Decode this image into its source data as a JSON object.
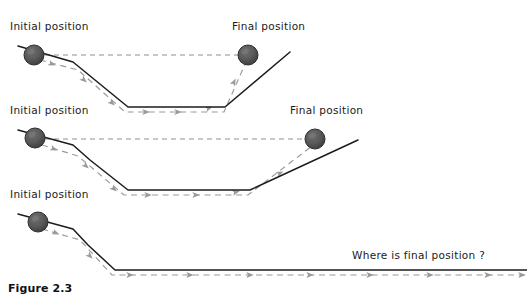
{
  "figure": {
    "caption": "Figure 2.3",
    "background_color": "#ffffff",
    "ink_color": "#1c1c1c",
    "dash_color": "#9a9a9a",
    "ball_color": "#555555"
  },
  "panels": [
    {
      "id": "panel-steep-valley",
      "initial_label": "Initial position",
      "final_label": "Final position",
      "track_points": "18,46 73,62 128,107 195,107 225,107 290,52",
      "level_line": "36,55 248,55",
      "path_points": "40,60 78,70 125,112 190,112 224,112 246,62",
      "balls": [
        {
          "name": "initial-ball",
          "cx": 34,
          "cy": 55,
          "r": 10
        },
        {
          "name": "final-ball",
          "cx": 248,
          "cy": 55,
          "r": 10
        }
      ],
      "initial_label_pos": {
        "x": 10,
        "y": 30
      },
      "final_label_pos": {
        "x": 232,
        "y": 30
      },
      "arrow_positions": [
        {
          "x": 52,
          "y": 64,
          "angle": 22
        },
        {
          "x": 84,
          "y": 80,
          "angle": 42
        },
        {
          "x": 112,
          "y": 103,
          "angle": 42
        },
        {
          "x": 146,
          "y": 112,
          "angle": 0
        },
        {
          "x": 178,
          "y": 112,
          "angle": 0
        },
        {
          "x": 209,
          "y": 108,
          "angle": -20
        },
        {
          "x": 234,
          "y": 82,
          "angle": -63
        }
      ]
    },
    {
      "id": "panel-gentle-valley",
      "initial_label": "Initial position",
      "final_label": "Final position",
      "track_points": "18,130 73,145 90,160 128,190 203,190 250,190 358,140",
      "level_line": "36,139 315,139",
      "path_points": "42,145 78,156 124,195 200,195 248,195 312,146",
      "balls": [
        {
          "name": "initial-ball",
          "cx": 35,
          "cy": 138,
          "r": 10
        },
        {
          "name": "final-ball",
          "cx": 315,
          "cy": 139,
          "r": 10
        }
      ],
      "initial_label_pos": {
        "x": 10,
        "y": 114
      },
      "final_label_pos": {
        "x": 290,
        "y": 114
      },
      "arrow_positions": [
        {
          "x": 54,
          "y": 149,
          "angle": 22
        },
        {
          "x": 86,
          "y": 166,
          "angle": 42
        },
        {
          "x": 114,
          "y": 189,
          "angle": 42
        },
        {
          "x": 148,
          "y": 195,
          "angle": 0
        },
        {
          "x": 196,
          "y": 195,
          "angle": 0
        },
        {
          "x": 236,
          "y": 192,
          "angle": -13
        },
        {
          "x": 280,
          "y": 173,
          "angle": -25
        }
      ]
    },
    {
      "id": "panel-flat-track",
      "initial_label": "Initial position",
      "question_label": "Where is final position ?",
      "track_points": "18,214 73,229 88,245 115,270 527,270",
      "path_points": "42,229 80,240 112,275 527,275",
      "balls": [
        {
          "name": "initial-ball",
          "cx": 38,
          "cy": 222,
          "r": 10
        }
      ],
      "initial_label_pos": {
        "x": 10,
        "y": 198
      },
      "question_label_pos": {
        "x": 352,
        "y": 259
      },
      "arrow_positions": [
        {
          "x": 56,
          "y": 233,
          "angle": 22
        },
        {
          "x": 90,
          "y": 256,
          "angle": 45
        },
        {
          "x": 130,
          "y": 275,
          "angle": 0
        },
        {
          "x": 190,
          "y": 275,
          "angle": 0
        },
        {
          "x": 250,
          "y": 275,
          "angle": 0
        },
        {
          "x": 310,
          "y": 275,
          "angle": 0
        },
        {
          "x": 370,
          "y": 275,
          "angle": 0
        },
        {
          "x": 430,
          "y": 275,
          "angle": 0
        },
        {
          "x": 488,
          "y": 275,
          "angle": 0
        },
        {
          "x": 522,
          "y": 275,
          "angle": 0
        }
      ]
    }
  ],
  "caption_pos": {
    "x": 8,
    "y": 292
  }
}
